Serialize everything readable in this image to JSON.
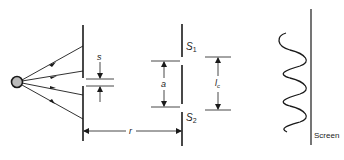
{
  "diagram": {
    "labels": {
      "slit_width": "s",
      "slit1": "S",
      "slit1_sub": "1",
      "slit2": "S",
      "slit2_sub": "2",
      "slit_separation": "a",
      "distance": "r",
      "coherence_length": "l",
      "coherence_length_sub": "c",
      "screen": "Screen"
    },
    "colors": {
      "stroke": "#1a1a1a",
      "source_fill": "#bbbbbb"
    }
  }
}
